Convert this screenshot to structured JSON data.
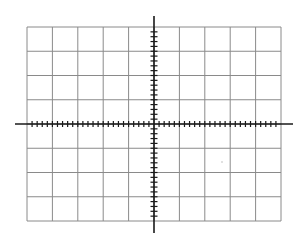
{
  "diagram": {
    "type": "coordinate-grid",
    "grid": {
      "columns": 10,
      "rows": 8,
      "left": 27,
      "top": 27,
      "right": 281,
      "bottom": 221,
      "line_color": "#8a8a8a"
    },
    "axes": {
      "origin": {
        "x": 154,
        "y": 124
      },
      "x_axis": {
        "from": 15,
        "to": 293,
        "tick_spacing_per_cell": 5
      },
      "y_axis": {
        "from": 16,
        "to": 233,
        "tick_spacing_per_cell": 5
      },
      "color": "#1a1a1a"
    },
    "artifacts": [
      {
        "type": "dot",
        "x": 222,
        "y": 162,
        "color": "#bbbbbb"
      }
    ]
  }
}
